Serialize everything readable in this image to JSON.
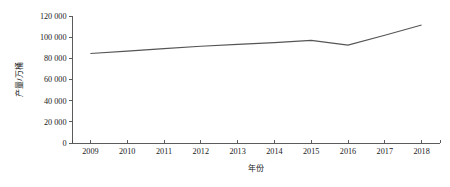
{
  "chart_data": {
    "type": "line",
    "title": "",
    "subtitle": "",
    "xlabel": "年份",
    "ylabel": "产量/万桶",
    "categories": [
      "2009",
      "2010",
      "2011",
      "2012",
      "2013",
      "2014",
      "2015",
      "2016",
      "2017",
      "2018"
    ],
    "x": [
      2009,
      2010,
      2011,
      2012,
      2013,
      2014,
      2015,
      2016,
      2017,
      2018
    ],
    "values": [
      84600,
      86800,
      89200,
      91400,
      93200,
      94800,
      97000,
      92500,
      101800,
      111500
    ],
    "series": [
      {
        "name": "产量",
        "values": [
          84600,
          86800,
          89200,
          91400,
          93200,
          94800,
          97000,
          92500,
          101800,
          111500
        ],
        "color": "#555555"
      }
    ],
    "xlim": [
      2008.5,
      2018.5
    ],
    "ylim": [
      0,
      120000
    ],
    "yticks": [
      0,
      20000,
      40000,
      60000,
      80000,
      100000,
      120000
    ],
    "ytick_labels": [
      "0",
      "20 000",
      "40 000",
      "60 000",
      "80 000",
      "100 000",
      "120 000"
    ],
    "xtick_labels": [
      "2009",
      "2010",
      "2011",
      "2012",
      "2013",
      "2014",
      "2015",
      "2016",
      "2017",
      "2018"
    ],
    "grid": false,
    "legend": false,
    "legend_position": "none",
    "line_color": "#555555",
    "axis_color": "#4a4a4a",
    "background": "#ffffff"
  }
}
